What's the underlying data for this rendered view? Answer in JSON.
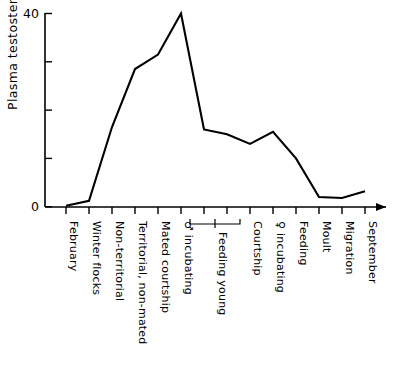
{
  "chart_data": {
    "type": "line",
    "title": "",
    "xlabel": "",
    "ylabel": "Plasma testosterone  (ng/ml)",
    "ylim": [
      0,
      40
    ],
    "yticks": [
      0,
      10,
      20,
      30,
      40
    ],
    "ytick_labels": [
      "0",
      "",
      "",
      "",
      "40"
    ],
    "grid": false,
    "legend": "none",
    "categories": [
      "February",
      "Winter flocks",
      "Non-territorial",
      "Territorial, non-mated",
      "Mated courtship",
      "♂ incubating",
      "",
      "",
      "Courtship",
      "♀ incubating",
      "Feeding",
      "Moult",
      "Migration",
      "September"
    ],
    "group_labels": [
      {
        "label": "Feeding young",
        "from_index": 6,
        "to_index": 8
      }
    ],
    "values": [
      0.2,
      1.2,
      16.5,
      28.5,
      31.5,
      40.0,
      16.0,
      15.0,
      13.0,
      15.5,
      10.0,
      2.0,
      1.8,
      3.2
    ],
    "series_name": "Plasma testosterone"
  },
  "axis": {
    "y_top_label": "40",
    "y_bottom_label": "0",
    "y_title": "Plasma testosterone  (ng/ml)"
  }
}
